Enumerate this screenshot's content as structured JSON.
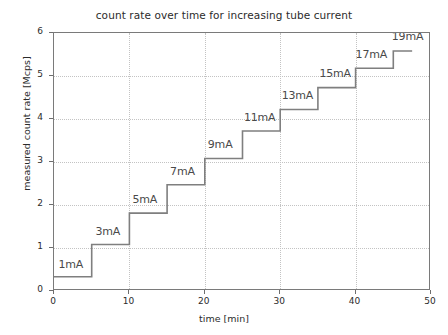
{
  "chart_data": {
    "type": "line",
    "title": "count rate over time for increasing tube current",
    "xlabel": "time [min]",
    "ylabel": "measured count rate [Mcps]",
    "xlim": [
      0,
      50
    ],
    "ylim": [
      0,
      6
    ],
    "xticks": [
      0,
      10,
      20,
      30,
      40,
      50
    ],
    "yticks": [
      0,
      1,
      2,
      3,
      4,
      5,
      6
    ],
    "xtick_labels": [
      "0",
      "10",
      "20",
      "30",
      "40",
      "50"
    ],
    "ytick_labels": [
      "0",
      "1",
      "2",
      "3",
      "4",
      "5",
      "6"
    ],
    "grid": true,
    "legend": "none",
    "line_color": "#7f7f7f",
    "series": [
      {
        "name": "measured count rate",
        "style": "step",
        "x": [
          0,
          5,
          5,
          10,
          10,
          15,
          15,
          20,
          20,
          25,
          25,
          30,
          30,
          35,
          35,
          40,
          40,
          45,
          45,
          47.5
        ],
        "y": [
          0.33,
          0.33,
          1.08,
          1.08,
          1.81,
          1.81,
          2.47,
          2.47,
          3.08,
          3.08,
          3.72,
          3.72,
          4.22,
          4.22,
          4.73,
          4.73,
          5.18,
          5.18,
          5.58,
          5.58
        ]
      }
    ],
    "steps": [
      {
        "label": "1mA",
        "current_mA": 1,
        "t_start": 0,
        "t_end": 5,
        "count_rate": 0.33
      },
      {
        "label": "3mA",
        "current_mA": 3,
        "t_start": 5,
        "t_end": 10,
        "count_rate": 1.08
      },
      {
        "label": "5mA",
        "current_mA": 5,
        "t_start": 10,
        "t_end": 15,
        "count_rate": 1.81
      },
      {
        "label": "7mA",
        "current_mA": 7,
        "t_start": 15,
        "t_end": 20,
        "count_rate": 2.47
      },
      {
        "label": "9mA",
        "current_mA": 9,
        "t_start": 20,
        "t_end": 25,
        "count_rate": 3.08
      },
      {
        "label": "11mA",
        "current_mA": 11,
        "t_start": 25,
        "t_end": 30,
        "count_rate": 3.72
      },
      {
        "label": "13mA",
        "current_mA": 13,
        "t_start": 30,
        "t_end": 35,
        "count_rate": 4.22
      },
      {
        "label": "15mA",
        "current_mA": 15,
        "t_start": 35,
        "t_end": 40,
        "count_rate": 4.73
      },
      {
        "label": "17mA",
        "current_mA": 17,
        "t_start": 40,
        "t_end": 45,
        "count_rate": 5.18
      },
      {
        "label": "19mA",
        "current_mA": 19,
        "t_start": 45,
        "t_end": 47.5,
        "count_rate": 5.58
      }
    ],
    "annotations": [
      {
        "text": "1mA",
        "x_min": 0.6,
        "y_value": 0.52
      },
      {
        "text": "3mA",
        "x_min": 5.5,
        "y_value": 1.28
      },
      {
        "text": "5mA",
        "x_min": 10.4,
        "y_value": 2.02
      },
      {
        "text": "7mA",
        "x_min": 15.4,
        "y_value": 2.68
      },
      {
        "text": "9mA",
        "x_min": 20.4,
        "y_value": 3.3
      },
      {
        "text": "11mA",
        "x_min": 25.2,
        "y_value": 3.94
      },
      {
        "text": "13mA",
        "x_min": 30.2,
        "y_value": 4.44
      },
      {
        "text": "15mA",
        "x_min": 35.2,
        "y_value": 4.95
      },
      {
        "text": "17mA",
        "x_min": 40.0,
        "y_value": 5.4
      },
      {
        "text": "19mA",
        "x_min": 44.8,
        "y_value": 5.82
      }
    ]
  }
}
